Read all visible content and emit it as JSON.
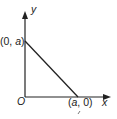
{
  "diagram": {
    "type": "coordinate-plot",
    "axes": {
      "x_label": "x",
      "y_label": "y",
      "origin_label": "O"
    },
    "points": [
      {
        "label_open": "(0, ",
        "label_var": "a",
        "label_close": ")",
        "coords": "(0, a)"
      },
      {
        "label_open": "(",
        "label_var": "a",
        "label_close": ", 0)",
        "coords": "(a, 0)"
      }
    ],
    "segment": {
      "from": "(0, a)",
      "to": "(a, 0)"
    },
    "colors": {
      "stroke": "#222222",
      "background": "#ffffff"
    }
  }
}
